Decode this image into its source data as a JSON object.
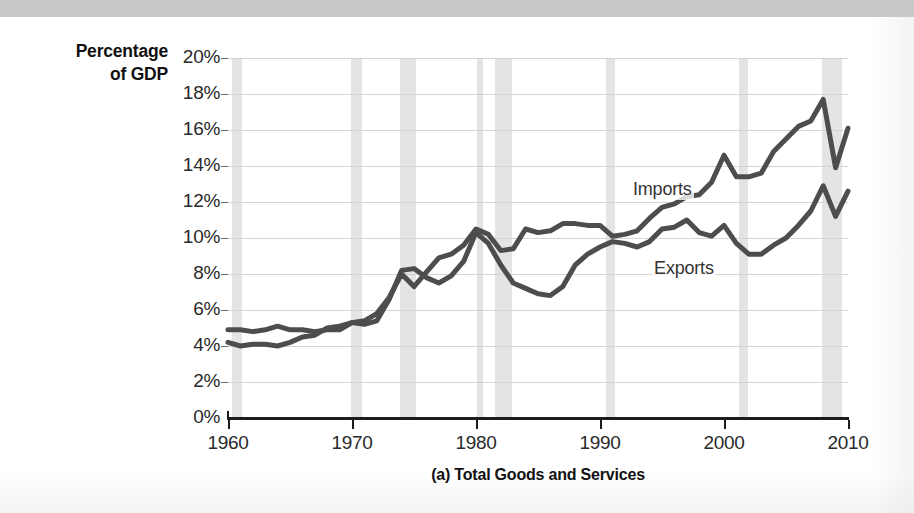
{
  "figure": {
    "caption": "(a) Total Goods and Services",
    "y_axis_title_line1": "Percentage",
    "y_axis_title_line2": "of GDP"
  },
  "chart_data": {
    "type": "line",
    "title": "(a) Total Goods and Services",
    "xlabel": "",
    "ylabel": "Percentage of GDP",
    "xlim": [
      1960,
      2010
    ],
    "ylim": [
      0,
      20
    ],
    "grid": true,
    "legend_position": "inline-annotation",
    "y_ticks": [
      "0%",
      "2%",
      "4%",
      "6%",
      "8%",
      "10%",
      "12%",
      "14%",
      "16%",
      "18%",
      "20%"
    ],
    "y_tick_values": [
      0,
      2,
      4,
      6,
      8,
      10,
      12,
      14,
      16,
      18,
      20
    ],
    "x_ticks": [
      "1960",
      "1970",
      "1980",
      "1990",
      "2000",
      "2010"
    ],
    "x_tick_values": [
      1960,
      1970,
      1980,
      1990,
      2000,
      2010
    ],
    "line_color": "#4d4d4d",
    "grid_color": "#d5d5d5",
    "recession_band_color": "#e4e4e4",
    "x": [
      1960,
      1961,
      1962,
      1963,
      1964,
      1965,
      1966,
      1967,
      1968,
      1969,
      1970,
      1971,
      1972,
      1973,
      1974,
      1975,
      1976,
      1977,
      1978,
      1979,
      1980,
      1981,
      1982,
      1983,
      1984,
      1985,
      1986,
      1987,
      1988,
      1989,
      1990,
      1991,
      1992,
      1993,
      1994,
      1995,
      1996,
      1997,
      1998,
      1999,
      2000,
      2001,
      2002,
      2003,
      2004,
      2005,
      2006,
      2007,
      2008,
      2009,
      2010
    ],
    "series": [
      {
        "name": "Exports",
        "label": "Exports",
        "values": [
          4.9,
          4.9,
          4.8,
          4.9,
          5.1,
          4.9,
          4.9,
          4.8,
          4.9,
          4.9,
          5.3,
          5.2,
          5.4,
          6.6,
          8.2,
          8.3,
          7.8,
          7.5,
          7.9,
          8.7,
          10.3,
          9.7,
          8.5,
          7.5,
          7.2,
          6.9,
          6.8,
          7.3,
          8.5,
          9.1,
          9.5,
          9.8,
          9.7,
          9.5,
          9.8,
          10.5,
          10.6,
          11.0,
          10.3,
          10.1,
          10.7,
          9.7,
          9.1,
          9.1,
          9.6,
          10.0,
          10.7,
          11.5,
          12.9,
          11.2,
          12.6
        ]
      },
      {
        "name": "Imports",
        "label": "Imports",
        "values": [
          4.2,
          4.0,
          4.1,
          4.1,
          4.0,
          4.2,
          4.5,
          4.6,
          5.0,
          5.1,
          5.3,
          5.4,
          5.8,
          6.7,
          8.0,
          7.3,
          8.1,
          8.9,
          9.1,
          9.6,
          10.5,
          10.2,
          9.3,
          9.4,
          10.5,
          10.3,
          10.4,
          10.8,
          10.8,
          10.7,
          10.7,
          10.1,
          10.2,
          10.4,
          11.1,
          11.7,
          11.9,
          12.3,
          12.4,
          13.1,
          14.6,
          13.4,
          13.4,
          13.6,
          14.8,
          15.5,
          16.2,
          16.5,
          17.7,
          13.9,
          16.1
        ]
      }
    ],
    "recession_bands": [
      {
        "start": 1960.3,
        "end": 1961.1
      },
      {
        "start": 1969.9,
        "end": 1970.8
      },
      {
        "start": 1973.9,
        "end": 1975.2
      },
      {
        "start": 1980.1,
        "end": 1980.6
      },
      {
        "start": 1981.5,
        "end": 1982.9
      },
      {
        "start": 1990.5,
        "end": 1991.2
      },
      {
        "start": 2001.2,
        "end": 2001.9
      },
      {
        "start": 2007.9,
        "end": 2009.5
      }
    ],
    "annotations": [
      {
        "text": "Imports",
        "x": 1992.5,
        "y": 12.6
      },
      {
        "text": "Exports",
        "x": 1994.2,
        "y": 8.2
      }
    ]
  }
}
